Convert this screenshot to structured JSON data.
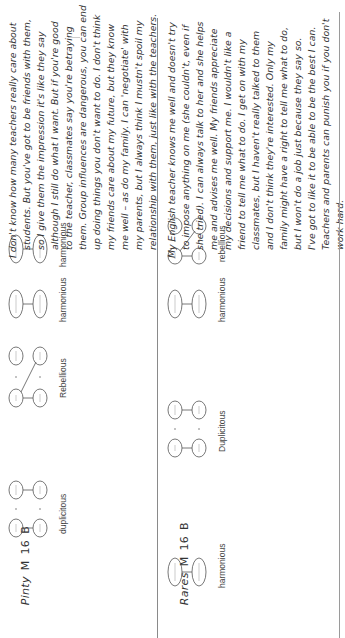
{
  "table": {
    "rows": [
      {
        "subject": "Pinty",
        "gender": "M",
        "age": "16",
        "group": "B",
        "diagrams": [
          {
            "type": "duplicitous-pairs",
            "label": "duplicitous"
          },
          {
            "type": "rebellious-cross",
            "label": "Rebellious"
          },
          {
            "type": "harmonious-pair",
            "label": "harmonious"
          },
          {
            "type": "harmonious-pair",
            "label": "harmonious"
          }
        ],
        "quote_lines": [
          "I don't know how many teachers really care about",
          "students. But you've got to be friends with them,",
          "so I give them the impression it's like they say",
          "although I still do what I want. But if you're good",
          "to the teacher, classmates say you're betraying",
          "them. Group influences are dangerous, you can end",
          "up doing things you don't want to do. I don't think",
          "my friends care about my future, but they know",
          "me well – as do my family. I can 'negotiate' with",
          "my parents, but I always think I mustn't spoil my",
          "relationship with them, just like with the teachers."
        ]
      },
      {
        "subject": "Rares",
        "gender": "M",
        "age": "16",
        "group": "B",
        "diagrams": [
          {
            "type": "harmonious-pair",
            "label": "harmonious"
          },
          {
            "type": "duplicitous-pairs",
            "label": "Duplicitous"
          },
          {
            "type": "harmonious-pair",
            "label": "harmonious"
          },
          {
            "type": "rebellious-cross",
            "label": "rebellious"
          }
        ],
        "quote_lines": [
          "My English teacher knows me well and doesn't try",
          "to impose anything on me (she couldn't, even if",
          "she tried). I can always talk to her and she helps",
          "me and advises me well. My friends appreciate",
          "my decisions and support me. I wouldn't like a",
          "friend to tell me what to do. I get on with my",
          "classmates, but I haven't really talked to them",
          "and I don't think they're interested. Only my",
          "family might have a right to tell me what to do,",
          "but I won't do a job just because they say so.",
          "I've got to like it to be able to be the best I can.",
          "Teachers and parents can punish you if you don't",
          "work hard."
        ]
      }
    ]
  },
  "colors": {
    "text": "#333333",
    "rule": "#8a8a8a",
    "node_stroke": "#555555"
  }
}
